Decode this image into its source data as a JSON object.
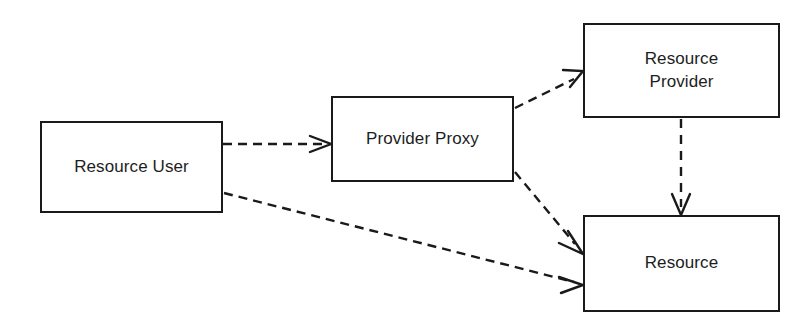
{
  "diagram": {
    "type": "block-diagram",
    "canvas": {
      "width": 804,
      "height": 327,
      "background": "#ffffff"
    },
    "style": {
      "node_border_color": "#1a1a1a",
      "node_fill": "#ffffff",
      "edge_color": "#1a1a1a",
      "edge_style": "dashed",
      "text_color": "#1d1d1d"
    },
    "nodes": [
      {
        "id": "resource-user",
        "label": "Resource User",
        "x": 40,
        "y": 121,
        "width": 183,
        "height": 92
      },
      {
        "id": "provider-proxy",
        "label": "Provider Proxy",
        "x": 331,
        "y": 96,
        "width": 183,
        "height": 86
      },
      {
        "id": "resource-provider",
        "label": "Resource\nProvider",
        "x": 583,
        "y": 23,
        "width": 197,
        "height": 95
      },
      {
        "id": "resource",
        "label": "Resource",
        "x": 583,
        "y": 215,
        "width": 197,
        "height": 97
      }
    ],
    "edges": [
      {
        "id": "user-to-proxy",
        "from": "resource-user",
        "to": "provider-proxy",
        "style": "dashed",
        "arrowhead": "open",
        "label": ""
      },
      {
        "id": "proxy-to-provider",
        "from": "provider-proxy",
        "to": "resource-provider",
        "style": "dashed",
        "arrowhead": "open",
        "label": ""
      },
      {
        "id": "proxy-to-resource",
        "from": "provider-proxy",
        "to": "resource",
        "style": "dashed",
        "arrowhead": "open",
        "label": ""
      },
      {
        "id": "user-to-resource",
        "from": "resource-user",
        "to": "resource",
        "style": "dashed",
        "arrowhead": "open",
        "label": ""
      },
      {
        "id": "provider-to-resource",
        "from": "resource-provider",
        "to": "resource",
        "style": "dashed",
        "arrowhead": "open",
        "label": ""
      }
    ]
  }
}
